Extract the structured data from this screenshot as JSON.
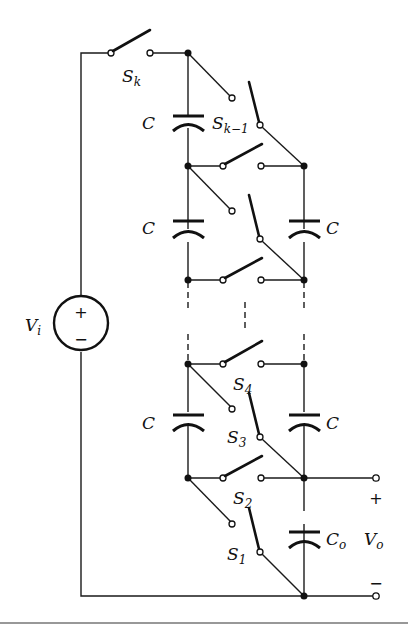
{
  "diagram": {
    "source": {
      "label": "V",
      "subscript": "i",
      "plus": "+",
      "minus": "−"
    },
    "switches": [
      {
        "label": "S",
        "subscript": "k"
      },
      {
        "label": "S",
        "subscript": "k−1"
      },
      {
        "label": "S",
        "subscript": "4"
      },
      {
        "label": "S",
        "subscript": "3"
      },
      {
        "label": "S",
        "subscript": "2"
      },
      {
        "label": "S",
        "subscript": "1"
      }
    ],
    "capacitors": {
      "left_top": "C",
      "left_mid": "C",
      "right_mid": "C",
      "left_low": "C",
      "right_low": "C",
      "output": {
        "label": "C",
        "subscript": "o"
      }
    },
    "output": {
      "label": "V",
      "subscript": "o",
      "plus": "+",
      "minus": "−"
    },
    "colors": {
      "line": "#111111",
      "background": "#ffffff"
    }
  }
}
